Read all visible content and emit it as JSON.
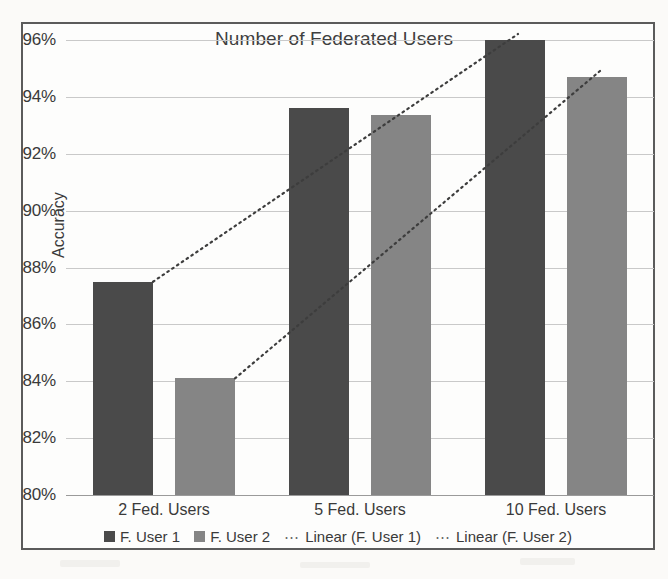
{
  "chart_data": {
    "type": "bar",
    "title": "Number of Federated Users",
    "xlabel": "",
    "ylabel": "Accuracy",
    "categories": [
      "2 Fed. Users",
      "5 Fed. Users",
      "10 Fed. Users"
    ],
    "series": [
      {
        "name": "F. User 1",
        "color": "#4a4a4a",
        "values": [
          87.5,
          93.6,
          96.0
        ]
      },
      {
        "name": "F. User 2",
        "color": "#858585",
        "values": [
          84.1,
          93.35,
          94.7
        ]
      }
    ],
    "trendlines": [
      {
        "name": "Linear (F. User 1)",
        "style": "dotted",
        "from": [
          87.5,
          96.0
        ]
      },
      {
        "name": "Linear (F. User 2)",
        "style": "dotted",
        "from": [
          84.1,
          94.7
        ]
      }
    ],
    "ylim": [
      80,
      96
    ],
    "ytick_step": 2,
    "ytick_labels": [
      "96%",
      "94%",
      "92%",
      "90%",
      "88%",
      "86%",
      "84%",
      "82%",
      "80%"
    ],
    "ytick_values": [
      96,
      94,
      92,
      90,
      88,
      86,
      84,
      82,
      80
    ],
    "grid": true,
    "legend_position": "bottom",
    "legend": [
      "F. User 1",
      "F. User 2",
      "Linear (F. User 1)",
      "Linear (F. User 2)"
    ]
  },
  "legend": {
    "items": [
      {
        "label": "F. User 1",
        "marker": "swatch-dark"
      },
      {
        "label": "F. User 2",
        "marker": "swatch-light"
      },
      {
        "label": "Linear (F. User 1)",
        "marker": "dotted-line"
      },
      {
        "label": "Linear (F. User 2)",
        "marker": "dotted-line"
      }
    ],
    "dots_glyph": "⋯"
  }
}
